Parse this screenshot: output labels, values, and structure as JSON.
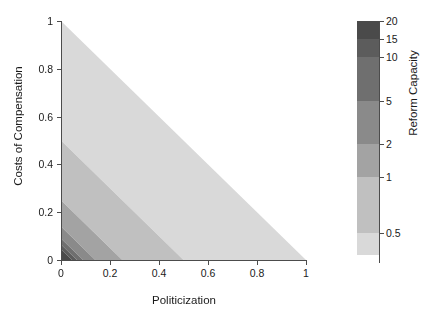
{
  "chart_data": {
    "type": "heatmap",
    "subtype": "filled-contour",
    "title": "",
    "xlabel": "Politicization",
    "ylabel": "Costs of Compensation",
    "xlim": [
      0,
      1
    ],
    "ylim": [
      0,
      1
    ],
    "xticks": [
      "0",
      "0.2",
      "0.4",
      "0.6",
      "0.8",
      "1"
    ],
    "xtick_values": [
      0,
      0.2,
      0.4,
      0.6,
      0.8,
      1
    ],
    "yticks": [
      "0",
      "0.2",
      "0.4",
      "0.6",
      "0.8",
      "1"
    ],
    "ytick_values": [
      0,
      0.2,
      0.4,
      0.6,
      0.8,
      1
    ],
    "grid": false,
    "legend": "colorbar-right",
    "domain_note": "Data defined only on lower-left triangle where x + y <= 1; upper-right is blank white.",
    "contour_variable": "Reform Capacity",
    "contour_levels": [
      0.5,
      1,
      2,
      5,
      10,
      15,
      20
    ],
    "bands": [
      {
        "label": "0.5 - 1",
        "x_plus_y_from": 0.5,
        "x_plus_y_to": 1.0,
        "color": "#d9d9d9"
      },
      {
        "label": "1 - 2",
        "x_plus_y_from": 0.25,
        "x_plus_y_to": 0.5,
        "color": "#c0c0c0"
      },
      {
        "label": "2 - 5",
        "x_plus_y_from": 0.14,
        "x_plus_y_to": 0.25,
        "color": "#a3a3a3"
      },
      {
        "label": "5 - 10",
        "x_plus_y_from": 0.09,
        "x_plus_y_to": 0.14,
        "color": "#8a8a8a"
      },
      {
        "label": "10 - 15",
        "x_plus_y_from": 0.065,
        "x_plus_y_to": 0.09,
        "color": "#6f6f6f"
      },
      {
        "label": "15 - 20",
        "x_plus_y_from": 0.045,
        "x_plus_y_to": 0.065,
        "color": "#5c5c5c"
      },
      {
        "label": "> 20",
        "x_plus_y_from": 0.0,
        "x_plus_y_to": 0.045,
        "color": "#4a4a4a"
      }
    ],
    "colorbar": {
      "title": "Reform Capacity",
      "ticks": [
        "20",
        "15",
        "10",
        "5",
        "2",
        "1",
        "0.5"
      ],
      "tick_values": [
        20,
        15,
        10,
        5,
        2,
        1,
        0.5
      ],
      "swatches": [
        {
          "value_range": "15 - 20",
          "color": "#4a4a4a"
        },
        {
          "value_range": "10 - 15",
          "color": "#5c5c5c"
        },
        {
          "value_range": "5 - 10",
          "color": "#6f6f6f"
        },
        {
          "value_range": "2 - 5",
          "color": "#8a8a8a"
        },
        {
          "value_range": "1 - 2",
          "color": "#a3a3a3"
        },
        {
          "value_range": "0.5 - 1",
          "color": "#c0c0c0"
        },
        {
          "value_range": "< 0.5",
          "color": "#d9d9d9"
        }
      ]
    },
    "axis_color": "#4c4c4c",
    "background": "#ffffff"
  }
}
